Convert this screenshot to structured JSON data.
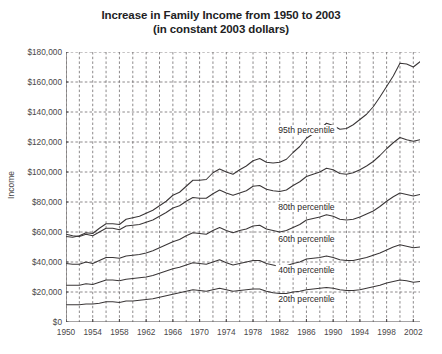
{
  "chart_data": {
    "type": "line",
    "title": "Increase in Family Income from 1950 to 2003",
    "subtitle": "(in constant 2003 dollars)",
    "xlabel": "",
    "ylabel": "Income",
    "xlim": [
      1950,
      2003
    ],
    "ylim": [
      0,
      180000
    ],
    "grid": true,
    "legend_position": "inline-labels",
    "y_ticks": [
      0,
      20000,
      40000,
      60000,
      80000,
      100000,
      120000,
      140000,
      160000,
      180000
    ],
    "y_tick_labels": [
      "$0",
      "$20,000",
      "$40,000",
      "$60,000",
      "$80,000",
      "$100,000",
      "$120,000",
      "$140,000",
      "$160,000",
      "$180,000"
    ],
    "x_ticks": [
      1950,
      1954,
      1958,
      1962,
      1966,
      1970,
      1974,
      1978,
      1982,
      1986,
      1990,
      1994,
      1998,
      2002
    ],
    "x_tick_labels": [
      "1950",
      "1954",
      "1958",
      "1962",
      "1966",
      "1970",
      "1974",
      "1978",
      "1982",
      "1986",
      "1990",
      "1994",
      "1998",
      "2002"
    ],
    "x": [
      1950,
      1951,
      1952,
      1953,
      1954,
      1955,
      1956,
      1957,
      1958,
      1959,
      1960,
      1961,
      1962,
      1963,
      1964,
      1965,
      1966,
      1967,
      1968,
      1969,
      1970,
      1971,
      1972,
      1973,
      1974,
      1975,
      1976,
      1977,
      1978,
      1979,
      1980,
      1981,
      1982,
      1983,
      1984,
      1985,
      1986,
      1987,
      1988,
      1989,
      1990,
      1991,
      1992,
      1993,
      1994,
      1995,
      1996,
      1997,
      1998,
      1999,
      2000,
      2001,
      2002,
      2003
    ],
    "series": [
      {
        "name": "95th percentile",
        "label": "95th percentile",
        "label_x": 1986,
        "label_y": 128000,
        "values": [
          57000,
          56500,
          57500,
          59500,
          59000,
          62500,
          65500,
          65500,
          65000,
          68500,
          69500,
          70500,
          72500,
          74500,
          77500,
          80500,
          84500,
          86500,
          90500,
          94500,
          94500,
          95000,
          99500,
          102000,
          100000,
          98500,
          101500,
          104000,
          107500,
          109000,
          106500,
          106000,
          106500,
          108500,
          113000,
          117000,
          122500,
          125500,
          128500,
          132500,
          131000,
          128500,
          129000,
          131500,
          135000,
          138500,
          143500,
          150000,
          157000,
          164000,
          172500,
          172000,
          170000,
          173500
        ]
      },
      {
        "name": "80th percentile",
        "label": "80th percentile",
        "label_x": 1986,
        "label_y": 76500,
        "values": [
          58500,
          57500,
          57000,
          58500,
          57500,
          60000,
          62500,
          62500,
          61500,
          64000,
          64500,
          65000,
          66500,
          68000,
          70500,
          73000,
          76000,
          77500,
          80500,
          83000,
          82500,
          82500,
          85500,
          88000,
          86000,
          84500,
          86000,
          87500,
          90500,
          91000,
          88500,
          87500,
          87000,
          88000,
          91000,
          93500,
          97000,
          98500,
          100000,
          102500,
          101500,
          99000,
          98500,
          99500,
          101500,
          104000,
          107000,
          111000,
          115500,
          119500,
          123000,
          121500,
          120500,
          121500
        ]
      },
      {
        "name": "60th percentile",
        "label": "60th percentile",
        "label_x": 1986,
        "label_y": 55500,
        "values": [
          39000,
          38500,
          38500,
          40000,
          39000,
          41000,
          43000,
          43000,
          42500,
          44000,
          44500,
          45000,
          46000,
          47500,
          49500,
          51500,
          53500,
          55000,
          57500,
          59500,
          59000,
          58500,
          61000,
          63000,
          61000,
          59500,
          61000,
          62000,
          64000,
          64500,
          62000,
          61000,
          60000,
          61000,
          63000,
          65000,
          68000,
          69000,
          70000,
          71500,
          70500,
          68500,
          68000,
          68500,
          70000,
          72000,
          74000,
          77000,
          80500,
          83500,
          86000,
          85000,
          84000,
          85000
        ]
      },
      {
        "name": "40th percentile",
        "label": "40th percentile",
        "label_x": 1986,
        "label_y": 35000,
        "values": [
          24500,
          24500,
          24500,
          25500,
          25000,
          26500,
          28000,
          28000,
          27500,
          28500,
          29000,
          29500,
          30000,
          31000,
          32500,
          34000,
          35500,
          36500,
          38000,
          39500,
          39000,
          38500,
          40000,
          41500,
          39500,
          38000,
          39000,
          40000,
          41000,
          41000,
          39000,
          38000,
          37000,
          37500,
          39000,
          40000,
          42000,
          42500,
          43000,
          44000,
          43000,
          41500,
          41000,
          41000,
          42000,
          43000,
          44500,
          46000,
          48000,
          50000,
          51500,
          50500,
          49500,
          50000
        ]
      },
      {
        "name": "20th percentile",
        "label": "20th percentile",
        "label_x": 1986,
        "label_y": 15500,
        "values": [
          11500,
          11500,
          11500,
          12000,
          12000,
          12500,
          13500,
          13500,
          13000,
          14000,
          14000,
          14500,
          15000,
          15500,
          16500,
          17500,
          18500,
          19500,
          20500,
          21500,
          21000,
          20500,
          21500,
          22500,
          21500,
          20500,
          21000,
          21500,
          22000,
          22000,
          20500,
          19500,
          19000,
          19000,
          20000,
          20500,
          21500,
          22000,
          22500,
          23000,
          22500,
          21500,
          21000,
          21000,
          21500,
          22500,
          23500,
          24500,
          26000,
          27000,
          28000,
          27500,
          26500,
          27000
        ]
      }
    ],
    "colors": {
      "line": "#3a3637",
      "grid": "#6f6b6c",
      "axis": "#4f4b4c",
      "text": "#231f20",
      "background": "#ffffff"
    }
  }
}
